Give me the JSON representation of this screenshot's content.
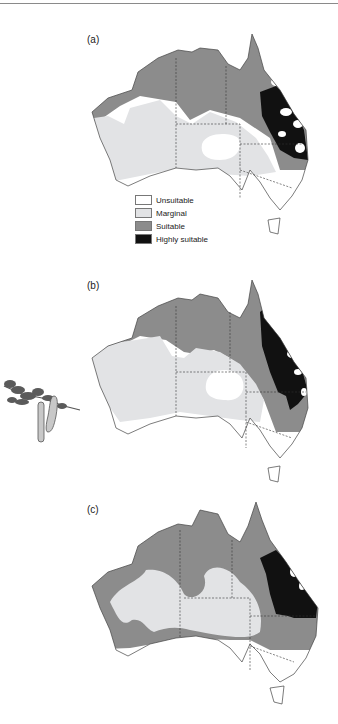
{
  "figure": {
    "panels": [
      {
        "label": "(a)"
      },
      {
        "label": "(b)"
      },
      {
        "label": "(c)"
      }
    ],
    "legend": {
      "items": [
        {
          "label": "Unsuitable",
          "color": "#ffffff"
        },
        {
          "label": "Marginal",
          "color": "#e2e3e5"
        },
        {
          "label": "Suitable",
          "color": "#8c8c8c"
        },
        {
          "label": "Highly suitable",
          "color": "#111111"
        }
      ]
    },
    "illustration": "acacia-branch-with-seed-pods"
  }
}
